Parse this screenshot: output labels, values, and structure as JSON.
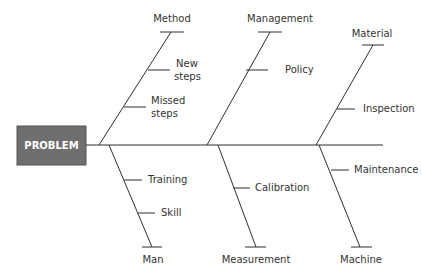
{
  "diagram": {
    "type": "fishbone",
    "problem": {
      "label": "PROBLEM",
      "fill": "#6f6f6f",
      "text_color": "#ffffff"
    },
    "line_color": "#2f2f2f",
    "categories": [
      {
        "name": "Method",
        "position": "top",
        "causes": [
          "New steps",
          "Missed steps"
        ]
      },
      {
        "name": "Management",
        "position": "top",
        "causes": [
          "Policy"
        ]
      },
      {
        "name": "Material",
        "position": "top",
        "causes": [
          "Inspection"
        ]
      },
      {
        "name": "Man",
        "position": "bottom",
        "causes": [
          "Training",
          "Skill"
        ]
      },
      {
        "name": "Measurement",
        "position": "bottom",
        "causes": [
          "Calibration"
        ]
      },
      {
        "name": "Machine",
        "position": "bottom",
        "causes": [
          "Maintenance"
        ]
      }
    ]
  },
  "labels": {
    "problem": "PROBLEM",
    "method": "Method",
    "new_steps_1": "New",
    "new_steps_2": "steps",
    "missed_steps_1": "Missed",
    "missed_steps_2": "steps",
    "management": "Management",
    "policy": "Policy",
    "material": "Material",
    "inspection": "Inspection",
    "man": "Man",
    "training": "Training",
    "skill": "Skill",
    "measurement": "Measurement",
    "calibration": "Calibration",
    "machine": "Machine",
    "maintenance": "Maintenance"
  }
}
